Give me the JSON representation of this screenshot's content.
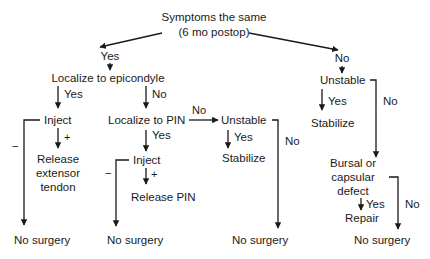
{
  "diagram": {
    "type": "decision-flowchart",
    "nodes": {
      "root_line1": "Symptoms the same",
      "root_line2": "(6 mo postop)",
      "yes_top": "Yes",
      "no_top": "No",
      "localize_epicondyle": "Localize to epicondyle",
      "inject_1": "Inject",
      "release_ext_line1": "Release",
      "release_ext_line2": "extensor",
      "release_ext_line3": "tendon",
      "localize_pin": "Localize to PIN",
      "unstable_mid": "Unstable",
      "stabilize_mid": "Stabilize",
      "inject_2": "Inject",
      "release_pin": "Release PIN",
      "unstable_right": "Unstable",
      "stabilize_right": "Stabilize",
      "bursal_line1": "Bursal or",
      "bursal_line2": "capsular",
      "bursal_line3": "defect",
      "repair": "Repair",
      "no_surgery_1": "No surgery",
      "no_surgery_2": "No surgery",
      "no_surgery_3": "No surgery",
      "no_surgery_4": "No surgery"
    },
    "edge_labels": {
      "epi_yes": "Yes",
      "epi_no": "No",
      "inject1_minus": "−",
      "inject1_plus": "+",
      "pin_yes": "Yes",
      "pin_no": "No",
      "unstable_mid_yes": "Yes",
      "unstable_mid_no": "No",
      "inject2_minus": "−",
      "inject2_plus": "+",
      "unstable_right_yes": "Yes",
      "unstable_right_no": "No",
      "bursal_yes": "Yes",
      "bursal_no": "No"
    }
  }
}
